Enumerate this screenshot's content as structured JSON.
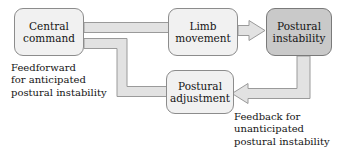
{
  "diagram": {
    "background_color": "#ffffff",
    "palette": {
      "node_light_fill": "#f1f1f1",
      "node_dark_fill": "#c9c9c9",
      "node_stroke": "#8c8c8c",
      "arrow_fill": "#e2e2e2",
      "arrow_stroke": "#9a9a9a",
      "text_color": "#141414"
    },
    "nodes": [
      {
        "id": "central-command",
        "line1": "Central",
        "line2": "command",
        "style": "light"
      },
      {
        "id": "limb-movement",
        "line1": "Limb",
        "line2": "movement",
        "style": "light"
      },
      {
        "id": "postural-instability",
        "line1": "Postural",
        "line2": "instability",
        "style": "dark"
      },
      {
        "id": "postural-adjustment",
        "line1": "Postural",
        "line2": "adjustment",
        "style": "light"
      }
    ],
    "annotations": [
      {
        "id": "feedforward-label",
        "line1": "Feedforward",
        "line2": "for anticipated",
        "line3": "postural instability"
      },
      {
        "id": "feedback-label",
        "line1": "Feedback for",
        "line2": "unanticipated",
        "line3": "postural instability"
      }
    ],
    "edges": [
      {
        "id": "central-to-limb",
        "from": "central-command",
        "to": "limb-movement",
        "direction": "right"
      },
      {
        "id": "central-to-adjustment",
        "from": "central-command",
        "to": "postural-adjustment",
        "direction": "down-right"
      },
      {
        "id": "limb-to-instability",
        "from": "limb-movement",
        "to": "postural-instability",
        "direction": "right"
      },
      {
        "id": "instability-to-adjustment",
        "from": "postural-instability",
        "to": "postural-adjustment",
        "direction": "down-left"
      }
    ]
  }
}
